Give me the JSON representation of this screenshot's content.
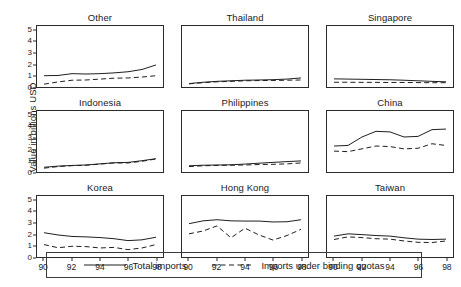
{
  "chart_data": {
    "type": "line",
    "title": "",
    "ylabel": "Value in billions USD",
    "xlabel": "",
    "layout": {
      "rows": 3,
      "cols": 3,
      "grid": false,
      "legend_position": "bottom"
    },
    "x": [
      90,
      91,
      92,
      93,
      94,
      95,
      96,
      97,
      98
    ],
    "xlim": [
      89.5,
      98.5
    ],
    "ylim": [
      0,
      5.4
    ],
    "xticks": [
      "90",
      "92",
      "94",
      "96",
      "98"
    ],
    "xtick_values": [
      90,
      92,
      94,
      96,
      98
    ],
    "yticks": [
      "0",
      "1",
      "2",
      "3",
      "4",
      "5"
    ],
    "ytick_values": [
      0,
      1,
      2,
      3,
      4,
      5
    ],
    "series_names": [
      "Total imports",
      "Imports under binding quotas"
    ],
    "panels": [
      {
        "name": "Other",
        "series": [
          {
            "name": "Total imports",
            "style": "solid",
            "values": [
              1.0,
              1.02,
              1.18,
              1.15,
              1.18,
              1.25,
              1.35,
              1.55,
              1.95
            ]
          },
          {
            "name": "Imports under binding quotas",
            "style": "dashed",
            "values": [
              0.25,
              0.45,
              0.6,
              0.62,
              0.7,
              0.78,
              0.8,
              0.88,
              1.0
            ]
          }
        ]
      },
      {
        "name": "Thailand",
        "series": [
          {
            "name": "Total imports",
            "style": "solid",
            "values": [
              0.3,
              0.42,
              0.5,
              0.55,
              0.6,
              0.62,
              0.65,
              0.7,
              0.8
            ]
          },
          {
            "name": "Imports under binding quotas",
            "style": "dashed",
            "values": [
              0.28,
              0.38,
              0.46,
              0.5,
              0.55,
              0.57,
              0.58,
              0.6,
              0.62
            ]
          }
        ]
      },
      {
        "name": "Singapore",
        "series": [
          {
            "name": "Total imports",
            "style": "solid",
            "values": [
              0.72,
              0.7,
              0.68,
              0.66,
              0.64,
              0.6,
              0.55,
              0.5,
              0.46
            ]
          },
          {
            "name": "Imports under binding quotas",
            "style": "dashed",
            "values": [
              0.42,
              0.42,
              0.41,
              0.41,
              0.4,
              0.4,
              0.39,
              0.38,
              0.38
            ]
          }
        ]
      },
      {
        "name": "Indonesia",
        "series": [
          {
            "name": "Total imports",
            "style": "solid",
            "values": [
              0.42,
              0.52,
              0.58,
              0.62,
              0.72,
              0.82,
              0.85,
              1.0,
              1.18
            ]
          },
          {
            "name": "Imports under binding quotas",
            "style": "dashed",
            "values": [
              0.34,
              0.48,
              0.56,
              0.6,
              0.7,
              0.8,
              0.8,
              0.95,
              1.15
            ]
          }
        ]
      },
      {
        "name": "Philippines",
        "series": [
          {
            "name": "Total imports",
            "style": "solid",
            "values": [
              0.55,
              0.6,
              0.62,
              0.64,
              0.7,
              0.78,
              0.85,
              0.92,
              0.98
            ]
          },
          {
            "name": "Imports under binding quotas",
            "style": "dashed",
            "values": [
              0.48,
              0.55,
              0.58,
              0.6,
              0.62,
              0.66,
              0.68,
              0.72,
              0.8
            ]
          }
        ]
      },
      {
        "name": "China",
        "series": [
          {
            "name": "Total imports",
            "style": "solid",
            "values": [
              2.3,
              2.35,
              3.1,
              3.6,
              3.55,
              3.1,
              3.15,
              3.75,
              3.8
            ]
          },
          {
            "name": "Imports under binding quotas",
            "style": "dashed",
            "values": [
              1.85,
              1.8,
              2.05,
              2.3,
              2.25,
              2.05,
              2.1,
              2.5,
              2.35
            ]
          }
        ]
      },
      {
        "name": "Korea",
        "series": [
          {
            "name": "Total imports",
            "style": "solid",
            "values": [
              2.15,
              1.95,
              1.82,
              1.78,
              1.72,
              1.62,
              1.45,
              1.52,
              1.75
            ]
          },
          {
            "name": "Imports under binding quotas",
            "style": "dashed",
            "values": [
              1.1,
              0.82,
              0.95,
              0.92,
              0.8,
              0.85,
              0.65,
              0.8,
              1.1
            ]
          }
        ]
      },
      {
        "name": "Hong Kong",
        "series": [
          {
            "name": "Total imports",
            "style": "solid",
            "values": [
              2.95,
              3.2,
              3.3,
              3.2,
              3.18,
              3.18,
              3.1,
              3.12,
              3.3
            ]
          },
          {
            "name": "Imports under binding quotas",
            "style": "dashed",
            "values": [
              2.05,
              2.3,
              2.75,
              1.7,
              2.55,
              1.95,
              1.5,
              1.9,
              2.45
            ]
          }
        ]
      },
      {
        "name": "Taiwan",
        "series": [
          {
            "name": "Total imports",
            "style": "solid",
            "values": [
              1.85,
              2.05,
              1.98,
              1.9,
              1.85,
              1.7,
              1.58,
              1.55,
              1.58
            ]
          },
          {
            "name": "Imports under binding quotas",
            "style": "dashed",
            "values": [
              1.55,
              1.78,
              1.72,
              1.62,
              1.58,
              1.42,
              1.3,
              1.28,
              1.42
            ]
          }
        ]
      }
    ]
  },
  "legend": {
    "entries": [
      {
        "label": "Total imports",
        "style": "solid"
      },
      {
        "label": "Imports under binding quotas",
        "style": "dashed"
      }
    ]
  }
}
